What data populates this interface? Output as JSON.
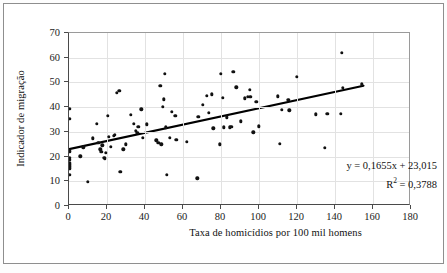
{
  "chart_data": {
    "type": "scatter",
    "title": "",
    "xlabel": "Taxa de homicídios por 100 mil homens",
    "ylabel": "Indicador de migração",
    "xlim": [
      0,
      180
    ],
    "ylim": [
      0,
      70
    ],
    "xticks": [
      0,
      20,
      40,
      60,
      80,
      100,
      120,
      140,
      160,
      180
    ],
    "yticks": [
      0,
      10,
      20,
      30,
      40,
      50,
      60,
      70
    ],
    "grid": true,
    "legend": "none",
    "marker_color": "#111111",
    "trendline_color": "#000000",
    "annotations": {
      "equation": "y = 0,1655x + 23,015",
      "r_squared_prefix": "R",
      "r_squared_sup": "2",
      "r_squared_value": " = 0,3788"
    },
    "trendline": {
      "slope": 0.1655,
      "intercept": 23.015,
      "r2": 0.3788,
      "x_start": 0,
      "x_end": 155
    },
    "points": [
      [
        0.4,
        39.4
      ],
      [
        0.4,
        35.4
      ],
      [
        0.4,
        22.2
      ],
      [
        0.4,
        19.6
      ],
      [
        0.4,
        18.6
      ],
      [
        0.4,
        17.6
      ],
      [
        0.4,
        16.8
      ],
      [
        0.4,
        16.0
      ],
      [
        0.4,
        15.2
      ],
      [
        0.4,
        12.6
      ],
      [
        6.0,
        20.1
      ],
      [
        7.5,
        23.8
      ],
      [
        9.8,
        9.7
      ],
      [
        12.5,
        27.4
      ],
      [
        14.5,
        33.2
      ],
      [
        15.5,
        25.6
      ],
      [
        16.5,
        23.0
      ],
      [
        17.0,
        22.0
      ],
      [
        17.5,
        24.6
      ],
      [
        18.5,
        19.6
      ],
      [
        19.0,
        19.0
      ],
      [
        19.5,
        21.5
      ],
      [
        20.5,
        36.6
      ],
      [
        21.0,
        28.0
      ],
      [
        22.0,
        24.0
      ],
      [
        23.5,
        28.5
      ],
      [
        24.0,
        28.8
      ],
      [
        25.0,
        45.9
      ],
      [
        26.5,
        46.6
      ],
      [
        27.0,
        13.9
      ],
      [
        28.5,
        22.9
      ],
      [
        30.0,
        25.0
      ],
      [
        32.5,
        36.8
      ],
      [
        34.0,
        33.3
      ],
      [
        35.0,
        30.5
      ],
      [
        36.0,
        29.5
      ],
      [
        36.5,
        32.0
      ],
      [
        38.0,
        39.2
      ],
      [
        39.0,
        27.7
      ],
      [
        41.0,
        33.1
      ],
      [
        46.0,
        26.6
      ],
      [
        47.0,
        25.5
      ],
      [
        48.0,
        48.6
      ],
      [
        48.5,
        24.9
      ],
      [
        49.5,
        40.1
      ],
      [
        50.0,
        43.2
      ],
      [
        50.5,
        53.4
      ],
      [
        51.0,
        31.9
      ],
      [
        51.5,
        12.6
      ],
      [
        53.0,
        27.5
      ],
      [
        54.0,
        38.1
      ],
      [
        56.0,
        36.6
      ],
      [
        56.5,
        26.9
      ],
      [
        62.0,
        25.9
      ],
      [
        67.5,
        11.2
      ],
      [
        68.0,
        36.0
      ],
      [
        70.5,
        41.0
      ],
      [
        72.5,
        44.7
      ],
      [
        73.5,
        37.8
      ],
      [
        75.0,
        45.2
      ],
      [
        76.0,
        31.5
      ],
      [
        79.5,
        24.9
      ],
      [
        80.0,
        53.5
      ],
      [
        81.0,
        43.9
      ],
      [
        81.5,
        31.8
      ],
      [
        83.0,
        35.9
      ],
      [
        84.5,
        31.9
      ],
      [
        85.5,
        32.1
      ],
      [
        86.5,
        54.4
      ],
      [
        88.0,
        48.0
      ],
      [
        90.5,
        34.2
      ],
      [
        92.5,
        43.5
      ],
      [
        94.0,
        44.2
      ],
      [
        95.0,
        47.1
      ],
      [
        95.5,
        44.2
      ],
      [
        97.0,
        29.8
      ],
      [
        98.5,
        42.2
      ],
      [
        100.0,
        32.2
      ],
      [
        110.0,
        44.4
      ],
      [
        111.0,
        25.2
      ],
      [
        112.0,
        38.8
      ],
      [
        115.5,
        43.0
      ],
      [
        116.0,
        38.7
      ],
      [
        120.0,
        52.2
      ],
      [
        130.0,
        37.1
      ],
      [
        134.5,
        23.5
      ],
      [
        136.0,
        37.3
      ],
      [
        143.0,
        37.2
      ],
      [
        143.5,
        62.0
      ],
      [
        144.0,
        47.9
      ],
      [
        154.0,
        49.2
      ]
    ]
  }
}
